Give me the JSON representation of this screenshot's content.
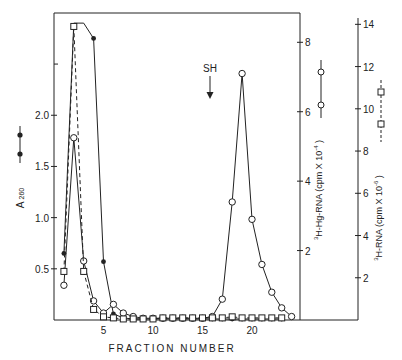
{
  "chart_data": {
    "type": "line",
    "title": "",
    "xlabel": "FRACTION NUMBER",
    "x_ticks": [
      5,
      10,
      15,
      20
    ],
    "xlim": [
      0,
      25
    ],
    "annotation": {
      "label": "SH",
      "x": 16,
      "arrow": "down"
    },
    "axes": [
      {
        "id": "left",
        "label": "A 260",
        "ticks": [
          "0.5",
          "1.0",
          "1.5",
          "2.0"
        ],
        "ylim": [
          0,
          2.95
        ],
        "legend_marker": "filled-circle solid"
      },
      {
        "id": "right_inner",
        "label": "3H-Hg-RNA (cpm X 10^-4)",
        "ticks": [
          "2",
          "4",
          "6",
          "8"
        ],
        "ylim": [
          0,
          8.7
        ],
        "legend_marker": "open-circle solid"
      },
      {
        "id": "right_outer",
        "label": "3H-RNA (cpm X 10^-6)",
        "ticks": [
          "2",
          "4",
          "6",
          "8",
          "10",
          "12",
          "14"
        ],
        "ylim": [
          0,
          14.3
        ],
        "legend_marker": "open-square dashed"
      }
    ],
    "series": [
      {
        "name": "A260",
        "axis": "left",
        "marker": "filled-circle",
        "line": "solid",
        "x": [
          1,
          2,
          3,
          4,
          5,
          6,
          7,
          8,
          9,
          10,
          11,
          12,
          13,
          14,
          15,
          16,
          17,
          18,
          19,
          20,
          21,
          22,
          23
        ],
        "values": [
          0.65,
          2.9,
          2.9,
          2.75,
          0.57,
          0.06,
          0.02,
          0.01,
          0.01,
          0.01,
          0.01,
          0.01,
          0.01,
          0.01,
          0.01,
          0.01,
          0.01,
          0.01,
          0.01,
          0.01,
          0.01,
          0.01,
          0.01
        ],
        "note": "off-scale plateau for fractions 2-4"
      },
      {
        "name": "3H-Hg-RNA",
        "axis": "right_inner",
        "marker": "open-circle",
        "line": "solid",
        "x": [
          1,
          2,
          3,
          4,
          5,
          6,
          7,
          8,
          9,
          10,
          11,
          12,
          13,
          14,
          15,
          16,
          17,
          18,
          19,
          20,
          21,
          22,
          23,
          24
        ],
        "values": [
          1.0,
          5.25,
          1.7,
          0.55,
          0.2,
          0.45,
          0.2,
          0.1,
          0.05,
          0.05,
          0.05,
          0.05,
          0.05,
          0.05,
          0.05,
          0.1,
          0.6,
          3.4,
          7.1,
          2.9,
          1.6,
          0.8,
          0.35,
          0.1
        ]
      },
      {
        "name": "3H-RNA",
        "axis": "right_outer",
        "marker": "open-square",
        "line": "dashed",
        "x": [
          1,
          2,
          3,
          4,
          5,
          6,
          7,
          8,
          9,
          10,
          11,
          12,
          13,
          14,
          15,
          16,
          17,
          18,
          19,
          20,
          21,
          22,
          23
        ],
        "values": [
          2.3,
          13.9,
          2.3,
          0.5,
          0.15,
          0.1,
          0.05,
          0.05,
          0.05,
          0.05,
          0.1,
          0.1,
          0.1,
          0.1,
          0.1,
          0.1,
          0.1,
          0.15,
          0.1,
          0.1,
          0.1,
          0.1,
          0.1
        ]
      }
    ]
  },
  "labels": {
    "xlabel": "FRACTION NUMBER",
    "annotation": "SH",
    "left_axis": "A",
    "left_axis_sub": "260",
    "right_inner_axis": "H-Hg-RNA (cpm X 10",
    "right_inner_sup": "-4",
    "right_outer_axis": "H-RNA (cpm X 10",
    "right_outer_sup": "-6",
    "iso_sup": "3"
  }
}
